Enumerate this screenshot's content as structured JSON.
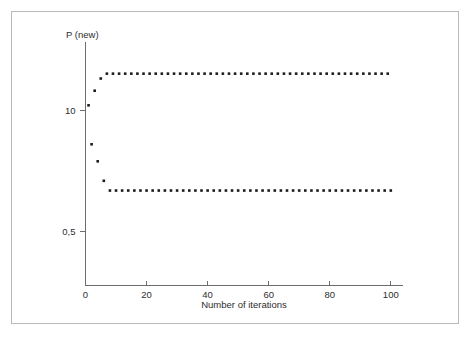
{
  "figure": {
    "background_color": "#ffffff",
    "frame_color": "#b9b9b9",
    "axis_color": "#6d6d6d",
    "point_color": "#1c1c1c"
  },
  "chart_data": {
    "type": "scatter",
    "title": "",
    "subtitle": "",
    "xlabel": "Number of iterations",
    "ylabel": "P (new)",
    "ylabel_position": "above-axis-top",
    "grid": false,
    "legend": null,
    "legend_position": "none",
    "xlim": [
      0,
      104
    ],
    "ylim": [
      0.28,
      1.28
    ],
    "xticks": [
      0,
      20,
      40,
      60,
      80,
      100
    ],
    "xticklabels": [
      "0",
      "20",
      "40",
      "60",
      "80",
      "100"
    ],
    "yticks": [
      1.0,
      0.5
    ],
    "yticklabels": [
      "10",
      "0,5"
    ],
    "annotations": [],
    "series": [
      {
        "name": "upper branch (even iterations)",
        "marker": "square",
        "converged_value": 1.15,
        "x": [
          1,
          3,
          5,
          7,
          9,
          11,
          13,
          15,
          17,
          19,
          21,
          23,
          25,
          27,
          29,
          31,
          33,
          35,
          37,
          39,
          41,
          43,
          45,
          47,
          49,
          51,
          53,
          55,
          57,
          59,
          61,
          63,
          65,
          67,
          69,
          71,
          73,
          75,
          77,
          79,
          81,
          83,
          85,
          87,
          89,
          91,
          93,
          95,
          97,
          99
        ],
        "y": [
          1.02,
          1.08,
          1.13,
          1.15,
          1.15,
          1.15,
          1.15,
          1.15,
          1.15,
          1.15,
          1.15,
          1.15,
          1.15,
          1.15,
          1.15,
          1.15,
          1.15,
          1.15,
          1.15,
          1.15,
          1.15,
          1.15,
          1.15,
          1.15,
          1.15,
          1.15,
          1.15,
          1.15,
          1.15,
          1.15,
          1.15,
          1.15,
          1.15,
          1.15,
          1.15,
          1.15,
          1.15,
          1.15,
          1.15,
          1.15,
          1.15,
          1.15,
          1.15,
          1.15,
          1.15,
          1.15,
          1.15,
          1.15,
          1.15,
          1.15
        ]
      },
      {
        "name": "lower branch (odd iterations)",
        "marker": "square",
        "converged_value": 0.67,
        "x": [
          2,
          4,
          6,
          8,
          10,
          12,
          14,
          16,
          18,
          20,
          22,
          24,
          26,
          28,
          30,
          32,
          34,
          36,
          38,
          40,
          42,
          44,
          46,
          48,
          50,
          52,
          54,
          56,
          58,
          60,
          62,
          64,
          66,
          68,
          70,
          72,
          74,
          76,
          78,
          80,
          82,
          84,
          86,
          88,
          90,
          92,
          94,
          96,
          98,
          100
        ],
        "y": [
          0.86,
          0.79,
          0.71,
          0.67,
          0.67,
          0.67,
          0.67,
          0.67,
          0.67,
          0.67,
          0.67,
          0.67,
          0.67,
          0.67,
          0.67,
          0.67,
          0.67,
          0.67,
          0.67,
          0.67,
          0.67,
          0.67,
          0.67,
          0.67,
          0.67,
          0.67,
          0.67,
          0.67,
          0.67,
          0.67,
          0.67,
          0.67,
          0.67,
          0.67,
          0.67,
          0.67,
          0.67,
          0.67,
          0.67,
          0.67,
          0.67,
          0.67,
          0.67,
          0.67,
          0.67,
          0.67,
          0.67,
          0.67,
          0.67,
          0.67
        ]
      }
    ]
  }
}
